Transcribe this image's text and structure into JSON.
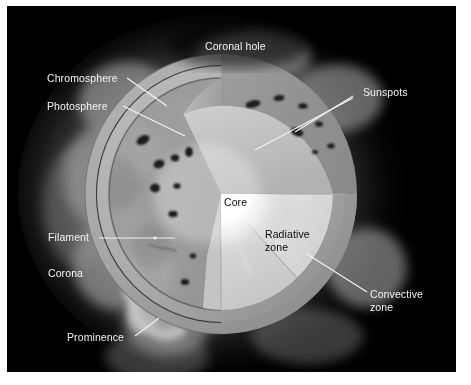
{
  "figure": {
    "background_color": "#000000",
    "page_color": "#ffffff",
    "label_color": "#f2f2f2",
    "interior_label_color": "#0a0a0a"
  },
  "labels": {
    "coronal_hole": "Coronal hole",
    "chromosphere": "Chromosphere",
    "photosphere": "Photosphere",
    "sunspots": "Sunspots",
    "filament": "Filament",
    "corona": "Corona",
    "prominence": "Prominence",
    "core": "Core",
    "radiative_zone_line1": "Radiative",
    "radiative_zone_line2": "zone",
    "convective_zone_line1": "Convective",
    "convective_zone_line2": "zone"
  }
}
